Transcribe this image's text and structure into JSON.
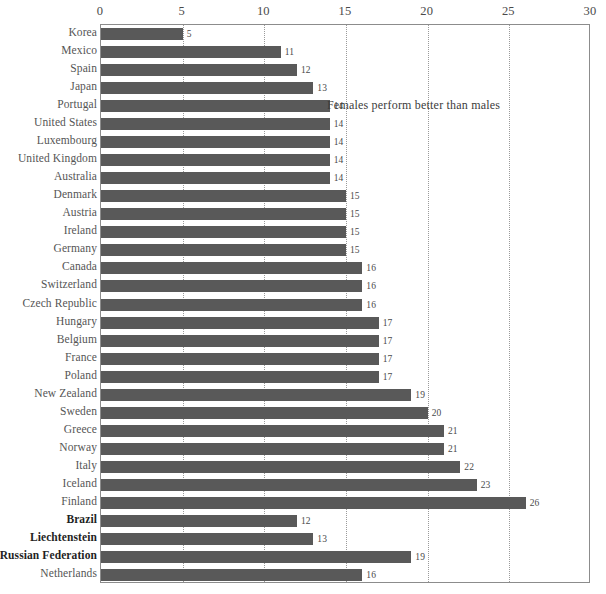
{
  "chart_data": {
    "type": "bar",
    "orientation": "horizontal",
    "title": "",
    "xlabel": "",
    "ylabel": "",
    "xlim": [
      0,
      30
    ],
    "xticks": [
      0,
      5,
      10,
      15,
      20,
      25,
      30
    ],
    "grid": true,
    "legend": "none",
    "bar_color": "#595959",
    "categories": [
      "Korea",
      "Mexico",
      "Spain",
      "Japan",
      "Portugal",
      "United States",
      "Luxembourg",
      "United Kingdom",
      "Australia",
      "Denmark",
      "Austria",
      "Ireland",
      "Germany",
      "Canada",
      "Switzerland",
      "Czech Republic",
      "Hungary",
      "Belgium",
      "France",
      "Poland",
      "New Zealand",
      "Sweden",
      "Greece",
      "Norway",
      "Italy",
      "Iceland",
      "Finland",
      "Brazil",
      "Liechtenstein",
      "Russian Federation",
      "Netherlands"
    ],
    "values": [
      5,
      11,
      12,
      13,
      14,
      14,
      14,
      14,
      14,
      15,
      15,
      15,
      15,
      16,
      16,
      16,
      17,
      17,
      17,
      17,
      19,
      20,
      21,
      21,
      22,
      23,
      26,
      12,
      13,
      19,
      16
    ],
    "bold_categories": [
      "Brazil",
      "Liechtenstein",
      "Russian Federation"
    ],
    "annotations": [
      {
        "text": "Females perform better than males",
        "x": 19.2,
        "row_index": 4
      }
    ]
  }
}
